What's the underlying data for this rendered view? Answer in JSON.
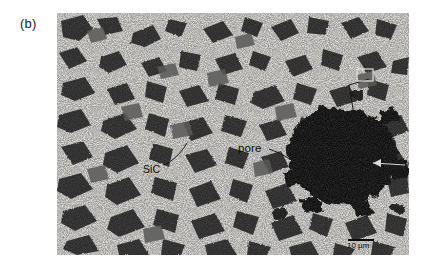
{
  "figure": {
    "panel_label": "(b)",
    "caption_present": false
  },
  "micrograph": {
    "alt_name": "sic-particulate-composite-micrograph",
    "frame": {
      "x": 57,
      "y": 13,
      "width": 352,
      "height": 242
    },
    "colors": {
      "matrix": "#d9d7d3",
      "matrix_light": "#e8e6e2",
      "grain_dark": "#2a2a2a",
      "grain_mid": "#4a4a4a",
      "pore_black": "#070707",
      "background": "#ffffff",
      "annotation_text": "#0d0d0d"
    },
    "annotations": [
      {
        "id": "sic",
        "text": "SiC",
        "x": 86,
        "y": 150,
        "leader": true
      },
      {
        "id": "pore",
        "text": "pore",
        "x": 181,
        "y": 129,
        "leader": true
      },
      {
        "id": "scale",
        "text": "10 µm",
        "x": 290,
        "y": 228,
        "leader": false
      }
    ],
    "scale_bar": {
      "label": "10 µm",
      "length_px": 26,
      "x": 291,
      "y": 226
    },
    "features": {
      "matrix_description": "light grey fine-grained matrix with fine speckle porosity",
      "grain_description": "angular dark SiC particulate grains",
      "pore_description": "large irregular black pore at right of field",
      "grain_count_visible": 96
    }
  }
}
